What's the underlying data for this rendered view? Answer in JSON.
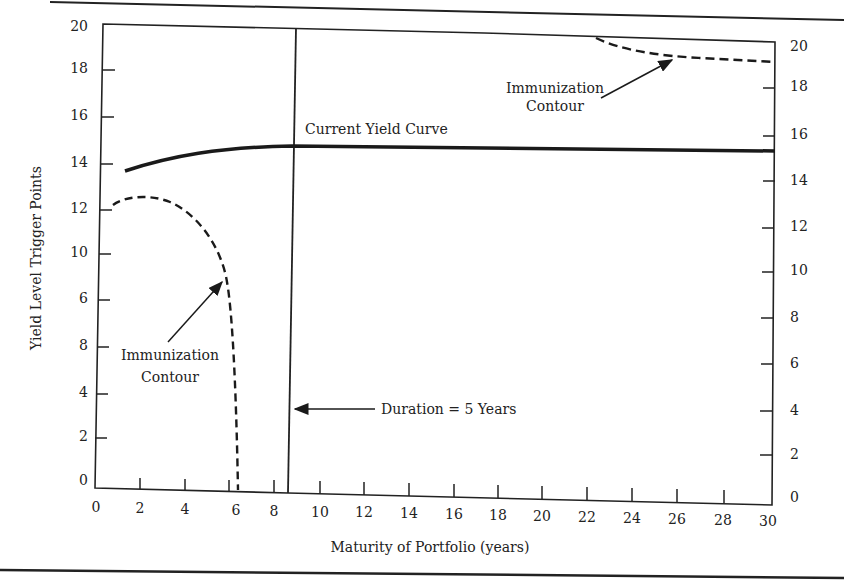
{
  "chart_data": {
    "type": "line",
    "title": "",
    "xlabel": "Maturity of Portfolio (years)",
    "ylabel": "Yield Level Trigger Points",
    "xlim": [
      0,
      30
    ],
    "ylim": [
      0,
      20
    ],
    "grid": false,
    "x_ticks": [
      "0",
      "2",
      "4",
      "6",
      "8",
      "10",
      "12",
      "14",
      "16",
      "18",
      "20",
      "22",
      "24",
      "26",
      "28",
      "30"
    ],
    "y_ticks_left": [
      "20",
      "18",
      "16",
      "14",
      "12",
      "10",
      "6",
      "8",
      "4",
      "2",
      "0"
    ],
    "y_ticks_right": [
      "20",
      "18",
      "16",
      "14",
      "12",
      "10",
      "8",
      "6",
      "4",
      "2",
      "0"
    ],
    "series": [
      {
        "name": "Current Yield Curve",
        "style": "solid-thick",
        "x": [
          1.5,
          3,
          5,
          7,
          8.7,
          12,
          16,
          20,
          24,
          28,
          30
        ],
        "y": [
          13.7,
          14.3,
          14.7,
          14.85,
          14.9,
          14.85,
          14.8,
          14.75,
          14.7,
          14.65,
          14.6
        ]
      },
      {
        "name": "Immunization Contour (lower)",
        "style": "dashed",
        "x": [
          0.8,
          2,
          3,
          4,
          5,
          5.7,
          5.9,
          6.0,
          6.1,
          6.2
        ],
        "y": [
          12.3,
          12.6,
          12.5,
          11.9,
          10.8,
          9.3,
          7.0,
          4.0,
          1.5,
          0
        ]
      },
      {
        "name": "Immunization Contour (upper)",
        "style": "dashed",
        "x": [
          22,
          24,
          26,
          28,
          30
        ],
        "y": [
          20,
          19.5,
          19.2,
          19.1,
          19.0
        ]
      },
      {
        "name": "Duration",
        "style": "vertical-line",
        "x": [
          8.7,
          8.7
        ],
        "y": [
          0,
          20
        ]
      }
    ],
    "annotations": [
      {
        "text": "Current Yield Curve",
        "x": 9.5,
        "y": 15.5
      },
      {
        "text": "Immunization Contour",
        "x": 21,
        "y": 18,
        "arrow_to": [
          26,
          19.3
        ]
      },
      {
        "text": "Immunization Contour",
        "x": 3,
        "y": 7.5,
        "arrow_to": [
          5.7,
          9.2
        ]
      },
      {
        "text": "Duration = 5 Years",
        "x": 13.5,
        "y": 3.5,
        "arrow_to": [
          8.8,
          3.5
        ]
      }
    ]
  },
  "labels": {
    "xlabel": "Maturity of Portfolio (years)",
    "ylabel": "Yield Level Trigger Points",
    "current_yield_curve": "Current Yield Curve",
    "contour_upper_line1": "Immunization",
    "contour_upper_line2": "Contour",
    "contour_lower_line1": "Immunization",
    "contour_lower_line2": "Contour",
    "duration": "Duration  =  5 Years"
  },
  "ticks": {
    "x": [
      {
        "label": "0",
        "px": 96
      },
      {
        "label": "2",
        "px": 140
      },
      {
        "label": "4",
        "px": 185
      },
      {
        "label": "6",
        "px": 236
      },
      {
        "label": "8",
        "px": 274
      },
      {
        "label": "10",
        "px": 320
      },
      {
        "label": "12",
        "px": 364
      },
      {
        "label": "14",
        "px": 409
      },
      {
        "label": "16",
        "px": 454
      },
      {
        "label": "18",
        "px": 498
      },
      {
        "label": "20",
        "px": 542
      },
      {
        "label": "22",
        "px": 587
      },
      {
        "label": "24",
        "px": 632
      },
      {
        "label": "26",
        "px": 677
      },
      {
        "label": "28",
        "px": 723
      },
      {
        "label": "30",
        "px": 768
      }
    ],
    "y_left": [
      {
        "label": "20",
        "py": 31
      },
      {
        "label": "18",
        "py": 73
      },
      {
        "label": "16",
        "py": 120
      },
      {
        "label": "14",
        "py": 167
      },
      {
        "label": "12",
        "py": 213
      },
      {
        "label": "10",
        "py": 257
      },
      {
        "label": "6",
        "py": 303
      },
      {
        "label": "8",
        "py": 350
      },
      {
        "label": "4",
        "py": 397
      },
      {
        "label": "2",
        "py": 441
      },
      {
        "label": "0",
        "py": 485
      }
    ],
    "y_right": [
      {
        "label": "20",
        "py": 51
      },
      {
        "label": "18",
        "py": 91
      },
      {
        "label": "16",
        "py": 139
      },
      {
        "label": "14",
        "py": 185
      },
      {
        "label": "12",
        "py": 231
      },
      {
        "label": "10",
        "py": 275
      },
      {
        "label": "8",
        "py": 322
      },
      {
        "label": "6",
        "py": 368
      },
      {
        "label": "4",
        "py": 415
      },
      {
        "label": "2",
        "py": 459
      },
      {
        "label": "0",
        "py": 502
      }
    ]
  }
}
